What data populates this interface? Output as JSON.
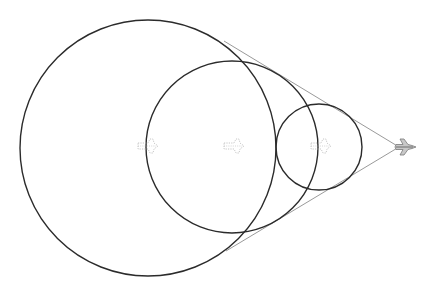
{
  "diagram": {
    "title": "",
    "background": "#ffffff",
    "circle_color": "#2b2b2b",
    "tangent_color": "#9a9a9a",
    "ghost_color": "#b8b8b8",
    "jet_fill": "#c8c8c8",
    "jet_stroke": "#7a7a7a",
    "circles": [
      {
        "name": "large",
        "cx": 148,
        "cy": 148,
        "r": 128
      },
      {
        "name": "medium",
        "cx": 232,
        "cy": 147,
        "r": 86
      },
      {
        "name": "small",
        "cx": 319,
        "cy": 147,
        "r": 43
      }
    ],
    "ghost_aircraft": [
      {
        "x": 146,
        "y": 146
      },
      {
        "x": 232,
        "y": 146
      },
      {
        "x": 319,
        "y": 146
      }
    ],
    "jet": {
      "x": 405,
      "y": 147
    },
    "tangent_points": [
      {
        "x": 224,
        "y": 41
      },
      {
        "x": 226,
        "y": 251
      }
    ]
  }
}
